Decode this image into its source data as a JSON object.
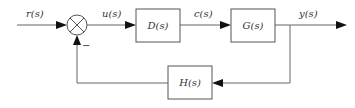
{
  "diagram": {
    "type": "feedback-control-block-diagram",
    "signals": {
      "input": "r(s)",
      "error": "u(s)",
      "control": "c(s)",
      "output": "y(s)"
    },
    "blocks": {
      "controller": "D(s)",
      "plant": "G(s)",
      "feedback": "H(s)"
    },
    "summing_junction": {
      "feedback_sign": "−"
    },
    "colors": {
      "line": "#666666",
      "box_border": "#555555",
      "arrow": "#111111",
      "text": "#333333",
      "background": "#ffffff"
    }
  }
}
